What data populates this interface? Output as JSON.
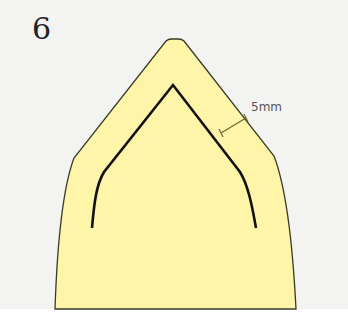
{
  "step": {
    "number": "6"
  },
  "diagram": {
    "offset_label": "5mm",
    "colors": {
      "fill": "#fef5a8",
      "outline": "#3a3a2a",
      "stitch_line": "#111111",
      "dimension_line": "#6b6a30",
      "background": "#f3f3f2"
    }
  }
}
